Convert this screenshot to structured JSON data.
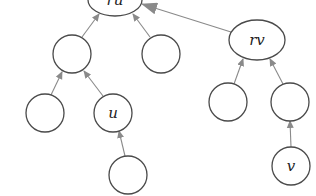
{
  "diagram": {
    "type": "union-find-forest",
    "colors": {
      "node_stroke": "#4a4a4a",
      "edge": "#8a8a8a",
      "arrowhead": "#8a8a8a",
      "background": "#ffffff"
    },
    "nodes": [
      {
        "id": "ru",
        "label": "ru",
        "cx": 115,
        "cy": 0,
        "rx": 27,
        "ry": 16
      },
      {
        "id": "rv",
        "label": "rv",
        "cx": 257,
        "cy": 40,
        "rx": 28,
        "ry": 20
      },
      {
        "id": "a",
        "label": "",
        "cx": 72,
        "cy": 54,
        "rx": 19,
        "ry": 19
      },
      {
        "id": "b",
        "label": "",
        "cx": 161,
        "cy": 54,
        "rx": 19,
        "ry": 19
      },
      {
        "id": "c",
        "label": "",
        "cx": 45,
        "cy": 113,
        "rx": 19,
        "ry": 19
      },
      {
        "id": "u",
        "label": "u",
        "cx": 113,
        "cy": 113,
        "rx": 19,
        "ry": 19
      },
      {
        "id": "d",
        "label": "",
        "cx": 128,
        "cy": 175,
        "rx": 19,
        "ry": 19
      },
      {
        "id": "e",
        "label": "",
        "cx": 228,
        "cy": 102,
        "rx": 19,
        "ry": 19
      },
      {
        "id": "f",
        "label": "",
        "cx": 290,
        "cy": 102,
        "rx": 19,
        "ry": 19
      },
      {
        "id": "v",
        "label": "v",
        "cx": 291,
        "cy": 166,
        "rx": 19,
        "ry": 19
      }
    ],
    "edges": [
      {
        "from": "a",
        "to": "ru",
        "x1": 82,
        "y1": 37,
        "x2": 99,
        "y2": 14
      },
      {
        "from": "b",
        "to": "ru",
        "x1": 150,
        "y1": 37,
        "x2": 133,
        "y2": 14
      },
      {
        "from": "rv",
        "to": "ru",
        "x1": 231,
        "y1": 32,
        "x2": 142,
        "y2": 4,
        "bold": true
      },
      {
        "from": "c",
        "to": "a",
        "x1": 51,
        "y1": 95,
        "x2": 62,
        "y2": 72
      },
      {
        "from": "u",
        "to": "a",
        "x1": 103,
        "y1": 96,
        "x2": 84,
        "y2": 71
      },
      {
        "from": "d",
        "to": "u",
        "x1": 125,
        "y1": 156,
        "x2": 119,
        "y2": 131
      },
      {
        "from": "e",
        "to": "rv",
        "x1": 234,
        "y1": 84,
        "x2": 243,
        "y2": 59
      },
      {
        "from": "f",
        "to": "rv",
        "x1": 283,
        "y1": 84,
        "x2": 270,
        "y2": 59
      },
      {
        "from": "v",
        "to": "f",
        "x1": 291,
        "y1": 147,
        "x2": 290,
        "y2": 121
      }
    ]
  }
}
